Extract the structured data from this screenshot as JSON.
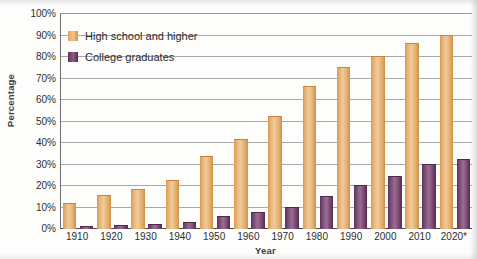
{
  "chart_data": {
    "type": "bar",
    "title": "",
    "xlabel": "Year",
    "ylabel": "Percentage",
    "categories": [
      "1910",
      "1920",
      "1930",
      "1940",
      "1950",
      "1960",
      "1970",
      "1980",
      "1990",
      "2000",
      "2010",
      "2020*"
    ],
    "ylim": [
      0,
      100
    ],
    "ytick_labels": [
      "0%",
      "10%",
      "20%",
      "30%",
      "40%",
      "50%",
      "60%",
      "70%",
      "80%",
      "90%",
      "100%"
    ],
    "ytick_values": [
      0,
      10,
      20,
      30,
      40,
      50,
      60,
      70,
      80,
      90,
      100
    ],
    "grid": true,
    "legend_position": "upper-left-inside",
    "series": [
      {
        "name": "High school and higher",
        "color": "#e0a860",
        "values": [
          11.5,
          15.5,
          18,
          22.5,
          33.5,
          41.5,
          52,
          66,
          75,
          80,
          86,
          90
        ]
      },
      {
        "name": "College graduates",
        "color": "#6f3f6a",
        "values": [
          1,
          1.5,
          2,
          3,
          5.5,
          7.5,
          10,
          15,
          20,
          24,
          30,
          32
        ]
      }
    ]
  },
  "axis": {
    "y_title": "Percentage",
    "x_title": "Year"
  },
  "legend": {
    "items": [
      {
        "label": "High school and higher",
        "swatch": "hs",
        "color": "#e0a860"
      },
      {
        "label": "College graduates",
        "swatch": "cg",
        "color": "#6f3f6a"
      }
    ]
  }
}
